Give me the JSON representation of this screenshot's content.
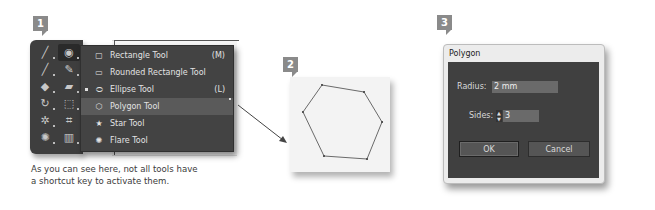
{
  "panels": [
    {
      "badge": "1"
    },
    {
      "badge": "2"
    },
    {
      "badge": "3"
    }
  ],
  "toolbar": {
    "tools": [
      {
        "name": "line-segment-tool",
        "glyph": "╱"
      },
      {
        "name": "ellipse-tool",
        "glyph": "◉",
        "active": true
      },
      {
        "name": "paintbrush-tool",
        "glyph": "╱"
      },
      {
        "name": "pencil-tool",
        "glyph": "✎"
      },
      {
        "name": "shaper-tool",
        "glyph": "◆"
      },
      {
        "name": "eraser-tool",
        "glyph": "▰"
      },
      {
        "name": "rotate-tool",
        "glyph": "↻"
      },
      {
        "name": "free-transform-tool",
        "glyph": "⬚"
      },
      {
        "name": "puppet-warp-tool",
        "glyph": "✲"
      },
      {
        "name": "perspective-grid-tool",
        "glyph": "⌗"
      },
      {
        "name": "symbol-sprayer-tool",
        "glyph": "✺"
      },
      {
        "name": "column-graph-tool",
        "glyph": "▥"
      }
    ]
  },
  "flyout": {
    "items": [
      {
        "label": "Rectangle Tool",
        "shortcut": "(M)",
        "icon": "rectangle-icon",
        "glyph": "▢",
        "selected": false,
        "highlighted": false
      },
      {
        "label": "Rounded Rectangle Tool",
        "shortcut": "",
        "icon": "rounded-rectangle-icon",
        "glyph": "▭",
        "selected": false,
        "highlighted": false
      },
      {
        "label": "Ellipse Tool",
        "shortcut": "(L)",
        "icon": "ellipse-icon",
        "glyph": "⬭",
        "selected": true,
        "highlighted": false
      },
      {
        "label": "Polygon Tool",
        "shortcut": "",
        "icon": "polygon-icon",
        "glyph": "⬡",
        "selected": false,
        "highlighted": true
      },
      {
        "label": "Star Tool",
        "shortcut": "",
        "icon": "star-icon",
        "glyph": "★",
        "selected": false,
        "highlighted": false
      },
      {
        "label": "Flare Tool",
        "shortcut": "",
        "icon": "flare-icon",
        "glyph": "✺",
        "selected": false,
        "highlighted": false
      }
    ]
  },
  "caption": {
    "line1": "As you can see here, not all tools have",
    "line2": "a shortcut key to activate them."
  },
  "dialog": {
    "title": "Polygon",
    "radius_label": "Radius:",
    "radius_value": "2 mm",
    "sides_label": "Sides:",
    "sides_value": "3",
    "ok_label": "OK",
    "cancel_label": "Cancel"
  },
  "colors": {
    "panel_dark": "#3e3e3e",
    "menu_bg": "#434343",
    "menu_highlight": "#5a5a5a",
    "badge": "#8a8a8a",
    "dialog_body": "#404040",
    "input_bg": "#6a6a6a"
  }
}
